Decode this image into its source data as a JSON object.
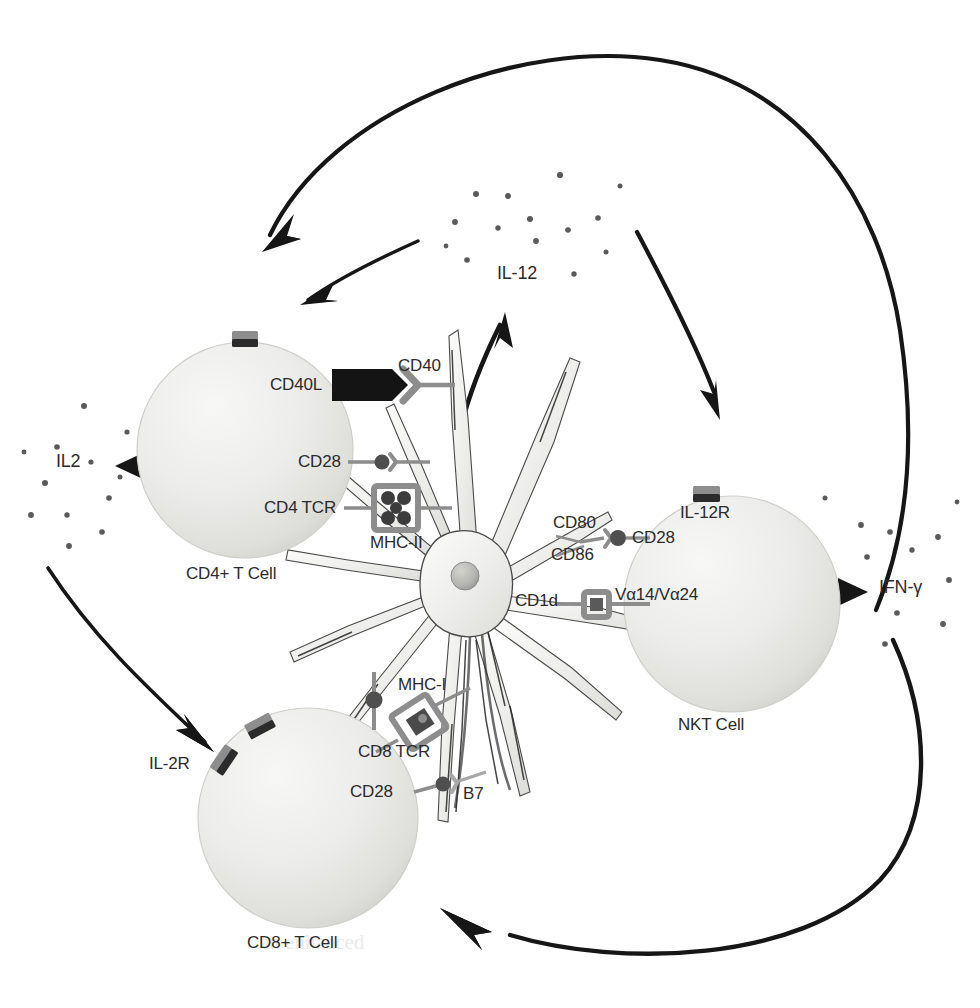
{
  "figure": {
    "type": "immunology-cell-interaction-diagram"
  },
  "cells": [
    {
      "id": "cd4",
      "name": "CD4+ T Cell",
      "receptors": [
        {
          "name": "CD40L",
          "partner": "CD40"
        },
        {
          "name": "CD28",
          "partner": ""
        },
        {
          "name": "CD4 TCR",
          "partner": "MHC-II"
        }
      ]
    },
    {
      "id": "cd8",
      "name": "CD8+ T Cell",
      "receptors": [
        {
          "name": "IL-2R",
          "partner": ""
        },
        {
          "name": "CD8 TCR",
          "partner": "MHC-I"
        },
        {
          "name": "CD28",
          "partner": "B7"
        }
      ]
    },
    {
      "id": "nkt",
      "name": "NKT Cell",
      "receptors": [
        {
          "name": "IL-12R",
          "partner": ""
        },
        {
          "name": "CD28",
          "partner": "CD80"
        },
        {
          "name": "CD28",
          "partner": "CD86"
        },
        {
          "name": "Vα14/Vα24",
          "partner": "CD1d"
        }
      ]
    },
    {
      "id": "dc",
      "name": "Dendritic Cell",
      "receptors": [
        {
          "name": "CD40",
          "partner": "CD40L"
        },
        {
          "name": "MHC-II",
          "partner": "CD4 TCR"
        },
        {
          "name": "MHC-I",
          "partner": "CD8 TCR"
        },
        {
          "name": "B7",
          "partner": "CD28"
        },
        {
          "name": "CD80",
          "partner": "CD28"
        },
        {
          "name": "CD86",
          "partner": "CD28"
        },
        {
          "name": "CD1d",
          "partner": "Vα14/Vα24"
        }
      ]
    }
  ],
  "cytokines": [
    {
      "id": "il2",
      "label": "IL2"
    },
    {
      "id": "il12",
      "label": "IL-12"
    },
    {
      "id": "ifng",
      "label": "IFN-γ"
    }
  ],
  "labels": {
    "cd4_cell": "CD4+ T Cell",
    "cd8_cell": "CD8+ T Cell",
    "nkt_cell": "NKT Cell",
    "cd40l": "CD40L",
    "cd40": "CD40",
    "cd28_cd4": "CD28",
    "cd4_tcr": "CD4 TCR",
    "mhc_ii": "MHC-II",
    "mhc_i": "MHC-I",
    "cd8_tcr": "CD8 TCR",
    "cd28_cd8": "CD28",
    "b7": "B7",
    "il2r": "IL-2R",
    "il12r": "IL-12R",
    "cd80": "CD80",
    "cd86": "CD86",
    "cd28_nkt": "CD28",
    "cd1d": "CD1d",
    "valpha": "Vα14/Vα24",
    "il2": "IL2",
    "il12": "IL-12",
    "ifng": "IFN-γ"
  },
  "colors": {
    "cell_fill_light": "#f0f0ee",
    "cell_fill_mid": "#dcdcd8",
    "cell_edge": "#c9c9c4",
    "receptor_gray": "#8d8d8d",
    "receptor_dark": "#4a4a4a",
    "arrow_black": "#161616",
    "text": "#2b2b2b",
    "dot": "#5a5a5a",
    "background": "#ffffff"
  },
  "cytokine_dots": {
    "il2_count": 12,
    "il12_count": 14,
    "ifng_count": 11
  },
  "ghost_text_lines": [
    "expressions using",
    "the specific",
    "tumors and tumor",
    "can be used",
    "cytokine release",
    "and",
    "studies indicate",
    "is used",
    "could also",
    "ated by",
    "In those studies",
    "produced a large",
    "TCR are still",
    "pecific CTL",
    "were able to",
    "an enhanced",
    "and"
  ]
}
